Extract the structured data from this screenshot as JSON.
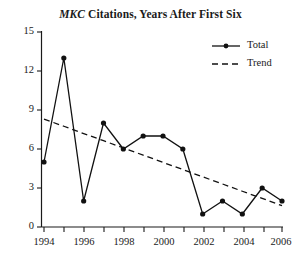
{
  "chart_data": {
    "type": "line",
    "title": "MKC Citations, Years After First Six",
    "title_italic_part": "MKC",
    "title_rest": " Citations, Years After First Six",
    "xlabel": "",
    "ylabel": "",
    "x": [
      1994,
      1995,
      1996,
      1997,
      1998,
      1999,
      2000,
      2001,
      2002,
      2003,
      2004,
      2005,
      2006
    ],
    "categories": [
      "1994",
      "1995",
      "1996",
      "1997",
      "1998",
      "1999",
      "2000",
      "2001",
      "2002",
      "2003",
      "2004",
      "2005",
      "2006"
    ],
    "series": [
      {
        "name": "Total",
        "style": "solid",
        "marker": "circle",
        "values": [
          5,
          13,
          2,
          8,
          6,
          7,
          7,
          6,
          1,
          2,
          1,
          3,
          2
        ]
      },
      {
        "name": "Trend",
        "style": "dashed",
        "marker": "none",
        "values": [
          8.3,
          7.75,
          7.19,
          6.64,
          6.08,
          5.53,
          4.97,
          4.42,
          3.86,
          3.31,
          2.75,
          2.2,
          1.64
        ]
      }
    ],
    "ylim": [
      0,
      15
    ],
    "xlim": [
      1994,
      2006
    ],
    "y_ticks": [
      0,
      3,
      6,
      9,
      12,
      15
    ],
    "y_tick_labels": [
      "0",
      "3",
      "6",
      "9",
      "12",
      "15"
    ],
    "x_ticks_major": [
      1994,
      1996,
      1998,
      2000,
      2002,
      2004,
      2006
    ],
    "x_tick_labels": [
      "1994",
      "1996",
      "1998",
      "2000",
      "2002",
      "2004",
      "2006"
    ],
    "x_ticks_minor": [
      1995,
      1997,
      1999,
      2001,
      2003,
      2005
    ],
    "grid": false,
    "legend_position": "top-right",
    "legend_entries": [
      "Total",
      "Trend"
    ],
    "colors": {
      "line": "#111111",
      "axis": "#1a1a1a",
      "background": "#ffffff",
      "text": "#1a1a1a"
    }
  },
  "legend": {
    "total_label": "Total",
    "trend_label": "Trend"
  }
}
